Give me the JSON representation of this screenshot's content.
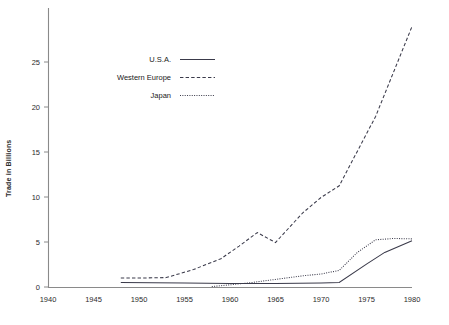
{
  "chart_data": {
    "type": "line",
    "title": "",
    "xlabel": "",
    "ylabel": "Trade in Billions",
    "xlim": [
      1940,
      1980
    ],
    "ylim": [
      0,
      29
    ],
    "grid": false,
    "legend_position": "upper-center-left",
    "x_ticks": [
      "1940",
      "1945",
      "1950",
      "1955",
      "1960",
      "1965",
      "1970",
      "1975",
      "1980"
    ],
    "y_ticks": [
      "0",
      "5",
      "10",
      "15",
      "20",
      "25"
    ],
    "series": [
      {
        "name": "U.S.A.",
        "style": "solid",
        "x": [
          1948,
          1955,
          1960,
          1965,
          1970,
          1972,
          1975,
          1977,
          1980
        ],
        "values": [
          0.55,
          0.5,
          0.45,
          0.45,
          0.5,
          0.55,
          2.6,
          3.9,
          5.2
        ]
      },
      {
        "name": "Western Europe",
        "style": "dashed",
        "x": [
          1948,
          1950,
          1953,
          1956,
          1959,
          1961,
          1963,
          1965,
          1968,
          1970,
          1972,
          1976,
          1980
        ],
        "values": [
          1.05,
          1.05,
          1.1,
          2.0,
          3.2,
          4.6,
          6.1,
          5.0,
          8.3,
          10.0,
          11.3,
          19.0,
          29.0
        ]
      },
      {
        "name": "Japan",
        "style": "dotted",
        "x": [
          1958,
          1962,
          1965,
          1968,
          1970,
          1972,
          1974,
          1976,
          1978,
          1980
        ],
        "values": [
          0.1,
          0.5,
          0.9,
          1.3,
          1.5,
          1.9,
          3.9,
          5.3,
          5.45,
          5.4
        ]
      }
    ]
  },
  "legend": {
    "entries": [
      {
        "label": "U.S.A."
      },
      {
        "label": "Western Europe"
      },
      {
        "label": "Japan"
      }
    ]
  }
}
